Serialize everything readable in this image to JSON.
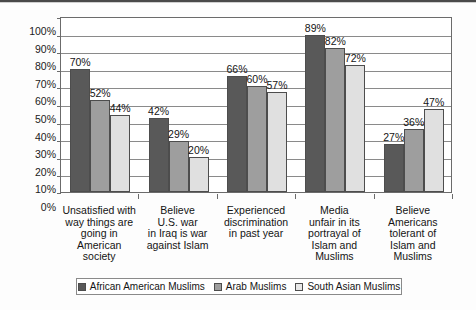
{
  "chart_data": {
    "type": "bar",
    "title": "",
    "xlabel": "",
    "ylabel": "",
    "ylim": [
      0,
      100
    ],
    "y_unit": "%",
    "grid": true,
    "legend_position": "bottom",
    "y_ticks": [
      "0%",
      "10%",
      "20%",
      "30%",
      "40%",
      "50%",
      "60%",
      "70%",
      "80%",
      "90%",
      "100%"
    ],
    "y_tick_values": [
      0,
      10,
      20,
      30,
      40,
      50,
      60,
      70,
      80,
      90,
      100
    ],
    "categories": [
      "Unsatisfied with way things are going in American society",
      "Believe U.S. war in Iraq is war against Islam",
      "Experienced discrimination in past year",
      "Media unfair in its portrayal of Islam and Muslims",
      "Believe Americans tolerant of Islam and Muslims"
    ],
    "category_lines": [
      [
        "Unsatisfied with",
        "way things are",
        "going in",
        "American",
        "society"
      ],
      [
        "Believe",
        "U.S. war",
        "in Iraq is war",
        "against Islam"
      ],
      [
        "Experienced",
        "discrimination",
        "in past year"
      ],
      [
        "Media",
        "unfair in its",
        "portrayal of",
        "Islam and",
        "Muslims"
      ],
      [
        "Believe",
        "Americans",
        "tolerant of",
        "Islam and",
        "Muslims"
      ]
    ],
    "series": [
      {
        "name": "African American Muslims",
        "color": "#595959",
        "values": [
          70,
          42,
          66,
          89,
          27
        ],
        "labels": [
          "70%",
          "42%",
          "66%",
          "89%",
          "27%"
        ]
      },
      {
        "name": "Arab Muslims",
        "color": "#9e9e9e",
        "values": [
          52,
          29,
          60,
          82,
          36
        ],
        "labels": [
          "52%",
          "29%",
          "60%",
          "82%",
          "36%"
        ]
      },
      {
        "name": "South Asian Muslims",
        "color": "#e0e0e0",
        "values": [
          44,
          20,
          57,
          72,
          47
        ],
        "labels": [
          "44%",
          "20%",
          "57%",
          "72%",
          "47%"
        ]
      }
    ]
  },
  "legend": {
    "items": [
      {
        "label": "African American Muslims",
        "swatch": "s0"
      },
      {
        "label": "Arab Muslims",
        "swatch": "s1"
      },
      {
        "label": "South Asian Muslims",
        "swatch": "s2"
      }
    ]
  }
}
